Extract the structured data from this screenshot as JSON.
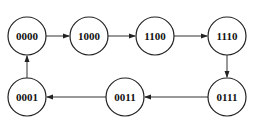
{
  "diagram": {
    "type": "state-transition-cycle",
    "node_radius": 19,
    "nodes": [
      {
        "id": "n0",
        "label": "0000",
        "cx": 27,
        "cy": 36
      },
      {
        "id": "n1",
        "label": "1000",
        "cx": 89,
        "cy": 36
      },
      {
        "id": "n2",
        "label": "1100",
        "cx": 155,
        "cy": 36
      },
      {
        "id": "n3",
        "label": "1110",
        "cx": 227,
        "cy": 36
      },
      {
        "id": "n4",
        "label": "0111",
        "cx": 227,
        "cy": 97
      },
      {
        "id": "n5",
        "label": "0011",
        "cx": 125,
        "cy": 97
      },
      {
        "id": "n6",
        "label": "0001",
        "cx": 27,
        "cy": 97
      }
    ],
    "edges": [
      {
        "from": "0000",
        "to": "1000"
      },
      {
        "from": "1000",
        "to": "1100"
      },
      {
        "from": "1100",
        "to": "1110"
      },
      {
        "from": "1110",
        "to": "0111"
      },
      {
        "from": "0111",
        "to": "0011"
      },
      {
        "from": "0011",
        "to": "0001"
      },
      {
        "from": "0001",
        "to": "0000"
      }
    ],
    "colors": {
      "stroke": "#222222",
      "text": "#111111",
      "background": "#ffffff"
    }
  }
}
